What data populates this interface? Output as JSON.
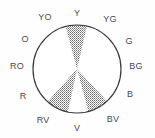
{
  "figure": {
    "name": "color-wheel",
    "background_color": "#fefefe",
    "circle": {
      "stroke_color": "#3a3a3a",
      "fill_color": "#ffffff",
      "center_x": 77,
      "center_y": 69,
      "radius": 44,
      "stroke_width": 1.2
    },
    "wedge_style": {
      "fill_color": "#8c8c8c",
      "pattern": "halftone-dots",
      "dot_color": "#7a7a7a",
      "dot_spacing": 2
    }
  },
  "labels": [
    {
      "text": "Y",
      "angle": 90,
      "x": 77,
      "y": 13
    },
    {
      "text": "YG",
      "angle": 60,
      "x": 110,
      "y": 19
    },
    {
      "text": "G",
      "angle": 30,
      "x": 129,
      "y": 41
    },
    {
      "text": "BG",
      "angle": 0,
      "x": 136,
      "y": 66
    },
    {
      "text": "B",
      "angle": 330,
      "x": 130,
      "y": 94
    },
    {
      "text": "BV",
      "angle": 300,
      "x": 113,
      "y": 119
    },
    {
      "text": "V",
      "angle": 270,
      "x": 77,
      "y": 128
    },
    {
      "text": "RV",
      "angle": 240,
      "x": 43,
      "y": 120
    },
    {
      "text": "R",
      "angle": 210,
      "x": 23,
      "y": 96
    },
    {
      "text": "RO",
      "angle": 180,
      "x": 17,
      "y": 66
    },
    {
      "text": "O",
      "angle": 150,
      "x": 25,
      "y": 39
    },
    {
      "text": "YO",
      "angle": 120,
      "x": 45,
      "y": 17
    }
  ],
  "wedges": [
    {
      "name": "wedge-yellow",
      "points_to": "Y",
      "start_angle": 77,
      "end_angle": 105,
      "fill": "#8c8c8c"
    },
    {
      "name": "wedge-red-violet",
      "points_to": "RV",
      "start_angle": 228,
      "end_angle": 258,
      "fill": "#8c8c8c"
    },
    {
      "name": "wedge-blue-violet",
      "points_to": "BV",
      "start_angle": 285,
      "end_angle": 313,
      "fill": "#8c8c8c"
    }
  ]
}
